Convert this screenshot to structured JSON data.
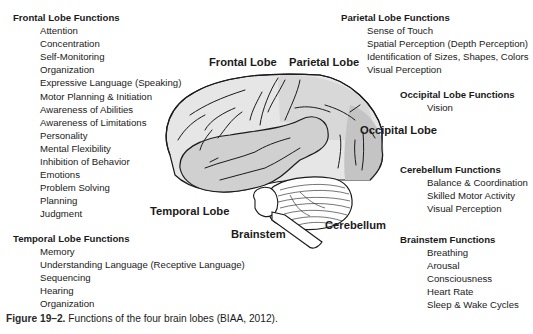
{
  "frontal_functions": {
    "title": "Frontal Lobe Functions",
    "items": [
      "Attention",
      "Concentration",
      "Self-Monitoring",
      "Organization",
      "Expressive Language (Speaking)",
      "Motor Planning & Initiation",
      "Awareness of Abilities",
      "Awareness of Limitations",
      "Personality",
      "Mental Flexibility",
      "Inhibition of Behavior",
      "Emotions",
      "Problem Solving",
      "Planning",
      "Judgment"
    ]
  },
  "temporal_functions": {
    "title": "Temporal Lobe Functions",
    "items": [
      "Memory",
      "Understanding Language (Receptive Language)",
      "Sequencing",
      "Hearing",
      "Organization"
    ]
  },
  "parietal_functions": {
    "title": "Parietal Lobe Functions",
    "items": [
      "Sense of Touch",
      "Spatial Perception (Depth Perception)",
      "Identification of Sizes, Shapes, Colors",
      "Visual Perception"
    ]
  },
  "occipital_functions": {
    "title": "Occipital Lobe Functions",
    "items": [
      "Vision"
    ]
  },
  "cerebellum_functions": {
    "title": "Cerebellum Functions",
    "items": [
      "Balance & Coordination",
      "Skilled Motor Activity",
      "Visual Perception"
    ]
  },
  "brainstem_functions": {
    "title": "Brainstem Functions",
    "items": [
      "Breathing",
      "Arousal",
      "Consciousness",
      "Heart Rate",
      "Sleep & Wake Cycles"
    ]
  },
  "diagram_labels": {
    "frontal": "Frontal Lobe",
    "parietal": "Parietal Lobe",
    "occipital": "Occipital Lobe",
    "temporal": "Temporal Lobe",
    "cerebellum": "Cerebellum",
    "brainstem": "Brainstem"
  },
  "colors": {
    "frontal_fill": "#e6e6e6",
    "parietal_fill": "#d6d6d6",
    "occipital_fill": "#c4c4c4",
    "temporal_fill": "#d0d0d0",
    "cerebellum_fill": "#ffffff",
    "outline": "#1a1a1a"
  },
  "caption": {
    "figure_label": "Figure 19–2.",
    "text": "Functions of the four brain lobes (BIAA, 2012)."
  }
}
